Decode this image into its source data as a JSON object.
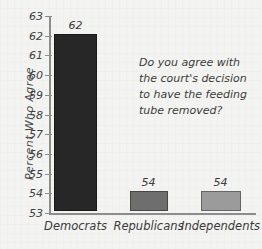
{
  "chart_data": {
    "type": "bar",
    "title": "",
    "subtitle": "",
    "xlabel": "",
    "ylabel": "Percent Who Agree",
    "categories": [
      "Democrats",
      "Republicans",
      "Independents"
    ],
    "values": [
      62,
      54,
      54
    ],
    "value_labels": [
      "62",
      "54",
      "54"
    ],
    "bar_colors": [
      "#272727",
      "#6e6e6e",
      "#9b9b9b"
    ],
    "ylim": [
      53,
      63
    ],
    "yticks": [
      53,
      54,
      55,
      56,
      57,
      58,
      59,
      60,
      61,
      62,
      63
    ],
    "ytick_labels": [
      "53",
      "54",
      "55",
      "56",
      "57",
      "58",
      "59",
      "60",
      "61",
      "62",
      "63"
    ],
    "grid": false,
    "legend": null,
    "legend_position": "none",
    "annotations": [
      {
        "text": "Do you agree with the court's decision to have the feeding tube removed?",
        "position": "upper-right"
      }
    ],
    "axis_color": "#8d8d8d",
    "background_color": "#f2f2f0",
    "text_color": "#3d3d3d"
  }
}
